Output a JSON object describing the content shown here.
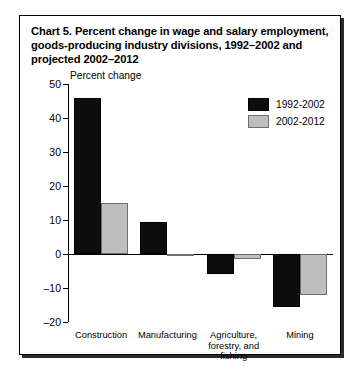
{
  "chart_data": {
    "type": "bar",
    "title": "Chart 5.  Percent change in wage and salary employment, goods-producing industry divisions, 1992–2002 and projected 2002–2012",
    "title_label": "Chart 5.",
    "title_body": "Percent change in wage and salary employment, goods-producing industry divisions, 1992–2002 and projected 2002–2012",
    "xlabel": "",
    "ylabel": "Percent change",
    "ylim": [
      -20,
      50
    ],
    "ytick_step": 10,
    "yticks": [
      50,
      40,
      30,
      20,
      10,
      0,
      -10,
      -20
    ],
    "ytick_labels": [
      "50",
      "40",
      "30",
      "20",
      "10",
      "0",
      "–10",
      "–20"
    ],
    "grid": false,
    "legend_position": "top-right",
    "categories": [
      "Construction",
      "Manufacturing",
      "Agriculture,\nforestry, and fishing",
      "Mining"
    ],
    "series": [
      {
        "name": "1992-2002",
        "color": "#0d0d0d",
        "values": [
          46.0,
          9.5,
          -6.0,
          -15.5
        ]
      },
      {
        "name": "2002-2012",
        "color": "#bebebe",
        "values": [
          15.0,
          -0.5,
          -1.5,
          -12.0
        ]
      }
    ]
  }
}
